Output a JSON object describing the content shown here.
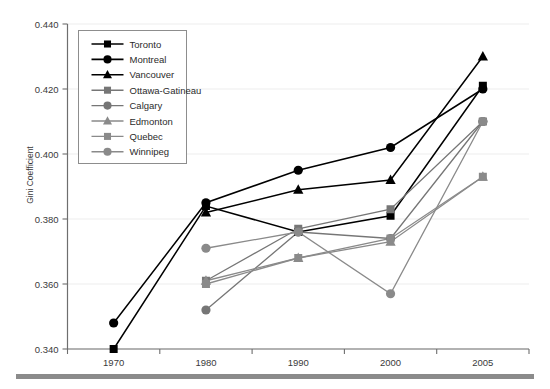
{
  "chart_data": {
    "type": "line",
    "title": "",
    "xlabel": "",
    "ylabel": "Gini Coefficient",
    "categories": [
      "1970",
      "1980",
      "1990",
      "2000",
      "2005"
    ],
    "x_tick_labels": [
      "1970",
      "1980",
      "1990",
      "2000",
      "2005"
    ],
    "y_tick_labels": [
      "0.340",
      "0.360",
      "0.380",
      "0.400",
      "0.420",
      "0.440"
    ],
    "y_tick_values": [
      0.34,
      0.36,
      0.38,
      0.4,
      0.42,
      0.44
    ],
    "ylim": [
      0.34,
      0.44
    ],
    "grid": true,
    "grid_axis": "y",
    "legend_position": "top-left",
    "series": [
      {
        "name": "Toronto",
        "marker": "square",
        "color": "#000000",
        "values": [
          0.34,
          0.384,
          0.376,
          0.381,
          0.421
        ]
      },
      {
        "name": "Montreal",
        "marker": "circle",
        "color": "#000000",
        "values": [
          0.348,
          0.385,
          0.395,
          0.402,
          0.42
        ]
      },
      {
        "name": "Vancouver",
        "marker": "triangle",
        "color": "#000000",
        "values": [
          null,
          0.382,
          0.389,
          0.392,
          0.43
        ]
      },
      {
        "name": "Ottawa-Gatineau",
        "marker": "square",
        "color": "#767676",
        "values": [
          null,
          0.361,
          0.377,
          0.383,
          0.41
        ]
      },
      {
        "name": "Calgary",
        "marker": "circle",
        "color": "#767676",
        "values": [
          null,
          0.352,
          0.376,
          0.374,
          0.41
        ]
      },
      {
        "name": "Edmonton",
        "marker": "triangle",
        "color": "#8a8a8a",
        "values": [
          null,
          0.361,
          0.368,
          0.373,
          0.393
        ]
      },
      {
        "name": "Quebec",
        "marker": "square",
        "color": "#8a8a8a",
        "values": [
          null,
          0.36,
          0.368,
          0.374,
          0.393
        ]
      },
      {
        "name": "Winnipeg",
        "marker": "circle",
        "color": "#8a8a8a",
        "values": [
          null,
          0.371,
          0.376,
          0.357,
          0.41
        ]
      }
    ],
    "colors": {
      "black_series": "#000000",
      "dark_gray_series": "#767676",
      "light_gray_series": "#8a8a8a",
      "gridline": "#ededed",
      "axis": "#6e6e6e",
      "background": "#ffffff",
      "bottom_rule": "#8b8b8b"
    }
  }
}
